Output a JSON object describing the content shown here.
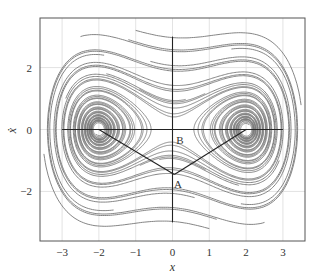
{
  "chart_data": {
    "type": "line",
    "title": "",
    "xlabel": "x",
    "ylabel": "ẋ",
    "xlim": [
      -3.6,
      3.6
    ],
    "ylim": [
      -3.6,
      3.6
    ],
    "xticks": [
      -3,
      -2,
      -1,
      0,
      1,
      2,
      3
    ],
    "xtick_labels": [
      "−3",
      "−2",
      "−1",
      "0",
      "1",
      "2",
      "3"
    ],
    "yticks": [
      -2,
      0,
      2
    ],
    "ytick_labels": [
      "−2",
      "0",
      "2"
    ],
    "grid": true,
    "legend": "none",
    "foci": [
      {
        "x": -2,
        "y": 0
      },
      {
        "x": 2,
        "y": 0
      }
    ],
    "reference_lines": [
      {
        "name": "horizontal-axis-line",
        "x": [
          -3,
          3
        ],
        "y": [
          0,
          0
        ]
      },
      {
        "name": "vertical-axis-line",
        "x": [
          0,
          0
        ],
        "y": [
          3,
          -3
        ]
      },
      {
        "name": "path-left-to-A",
        "x": [
          -2,
          0.05
        ],
        "y": [
          0,
          -1.45
        ]
      },
      {
        "name": "path-A-to-right",
        "x": [
          0.05,
          2
        ],
        "y": [
          -1.45,
          0
        ]
      }
    ],
    "annotations": [
      {
        "text": "A",
        "x": 0.15,
        "y": -1.75
      },
      {
        "text": "B",
        "x": 0.2,
        "y": -0.35
      }
    ],
    "trajectory_color": "#777777",
    "line_color": "#222222"
  }
}
